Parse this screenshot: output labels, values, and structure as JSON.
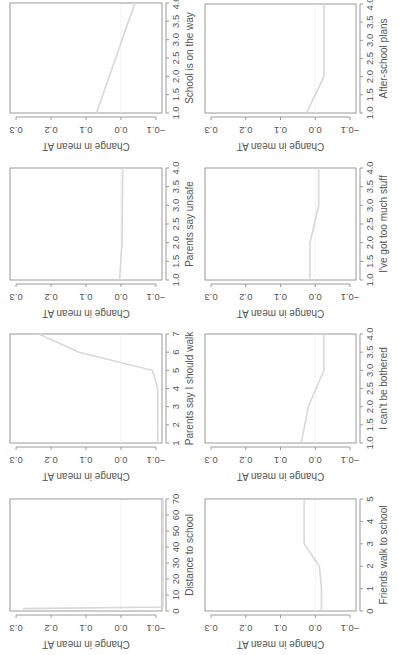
{
  "figure": {
    "line_color": "#d8d8d8",
    "zero_line_color": "#e6e6e6",
    "axis_color": "#9a9a9a",
    "text_color": "#555555",
    "ylabel": "Change in mean AT",
    "rotation": "-90deg"
  },
  "chart_data": [
    {
      "type": "line",
      "title": "",
      "xlabel": "School is on the way",
      "ylabel": "Change in mean AT",
      "xlim": [
        1.0,
        4.0
      ],
      "xticks": [
        "1.0",
        "1.5",
        "2.0",
        "2.5",
        "3.0",
        "3.5",
        "4.0"
      ],
      "xtick_values": [
        1.0,
        1.5,
        2.0,
        2.5,
        3.0,
        3.5,
        4.0
      ],
      "ylim": [
        -0.1,
        0.3
      ],
      "yticks": [
        "-0.1",
        "0.0",
        "0.1",
        "0.2",
        "0.3"
      ],
      "x": [
        1.0,
        4.0
      ],
      "values": [
        0.07,
        -0.04
      ],
      "zero_line": true,
      "screen_box": {
        "left": 10,
        "top": 3,
        "width": 152,
        "height": 110
      }
    },
    {
      "type": "line",
      "title": "",
      "xlabel": "Parents say unsafe",
      "ylabel": "Change in mean AT",
      "xlim": [
        1.0,
        4.0
      ],
      "xticks": [
        "1.0",
        "1.5",
        "2.0",
        "2.5",
        "3.0",
        "3.5",
        "4.0"
      ],
      "xtick_values": [
        1.0,
        1.5,
        2.0,
        2.5,
        3.0,
        3.5,
        4.0
      ],
      "ylim": [
        -0.1,
        0.3
      ],
      "yticks": [
        "-0.1",
        "0.0",
        "0.1",
        "0.2",
        "0.3"
      ],
      "x": [
        1.0,
        2.0,
        4.0
      ],
      "values": [
        0.004,
        -0.003,
        -0.005
      ],
      "zero_line": true,
      "screen_box": {
        "left": 10,
        "top": 168,
        "width": 152,
        "height": 112
      }
    },
    {
      "type": "line",
      "title": "",
      "xlabel": "Parents say I should walk",
      "ylabel": "Change in mean AT",
      "xlim": [
        1,
        7
      ],
      "xticks": [
        "1",
        "2",
        "3",
        "4",
        "5",
        "6",
        "7"
      ],
      "xtick_values": [
        1,
        2,
        3,
        4,
        5,
        6,
        7
      ],
      "ylim": [
        -0.1,
        0.3
      ],
      "yticks": [
        "-0.1",
        "0.0",
        "0.1",
        "0.2",
        "0.3"
      ],
      "x": [
        1,
        4,
        5,
        6,
        7
      ],
      "values": [
        -0.105,
        -0.105,
        -0.09,
        0.12,
        0.235
      ],
      "zero_line": true,
      "screen_box": {
        "left": 10,
        "top": 334,
        "width": 152,
        "height": 109
      }
    },
    {
      "type": "line",
      "title": "",
      "xlabel": "Distance to school",
      "ylabel": "Change in mean AT",
      "xlim": [
        0,
        70
      ],
      "xticks": [
        "0",
        "10",
        "20",
        "30",
        "40",
        "50",
        "60",
        "70"
      ],
      "xtick_values": [
        0,
        10,
        20,
        30,
        40,
        50,
        60,
        70
      ],
      "ylim": [
        -0.1,
        0.3
      ],
      "yticks": [
        "-0.1",
        "0.0",
        "0.1",
        "0.2",
        "0.3"
      ],
      "x": [
        1.5,
        2.5,
        3.5,
        71
      ],
      "values": [
        0.28,
        -0.12,
        -0.12,
        -0.12
      ],
      "zero_line": true,
      "screen_box": {
        "left": 10,
        "top": 499,
        "width": 152,
        "height": 112
      }
    },
    {
      "type": "line",
      "title": "",
      "xlabel": "After-school plans",
      "ylabel": "Change in mean AT",
      "xlim": [
        1.0,
        4.0
      ],
      "xticks": [
        "1.0",
        "1.5",
        "2.0",
        "2.5",
        "3.0",
        "3.5",
        "4.0"
      ],
      "xtick_values": [
        1.0,
        1.5,
        2.0,
        2.5,
        3.0,
        3.5,
        4.0
      ],
      "ylim": [
        -0.1,
        0.3
      ],
      "yticks": [
        "-0.1",
        "0.0",
        "0.1",
        "0.2",
        "0.3"
      ],
      "x": [
        1.0,
        2.0,
        4.0
      ],
      "values": [
        0.025,
        -0.025,
        -0.025
      ],
      "zero_line": true,
      "screen_box": {
        "left": 205,
        "top": 4,
        "width": 151,
        "height": 109
      }
    },
    {
      "type": "line",
      "title": "",
      "xlabel": "I've got too much stuff",
      "ylabel": "Change in mean AT",
      "xlim": [
        1.0,
        4.0
      ],
      "xticks": [
        "1.0",
        "1.5",
        "2.0",
        "2.5",
        "3.0",
        "3.5",
        "4.0"
      ],
      "xtick_values": [
        1.0,
        1.5,
        2.0,
        2.5,
        3.0,
        3.5,
        4.0
      ],
      "ylim": [
        -0.1,
        0.3
      ],
      "yticks": [
        "-0.1",
        "0.0",
        "0.1",
        "0.2",
        "0.3"
      ],
      "x": [
        1.0,
        2.0,
        3.0,
        4.0
      ],
      "values": [
        0.015,
        0.015,
        -0.01,
        -0.01
      ],
      "zero_line": true,
      "screen_box": {
        "left": 205,
        "top": 168,
        "width": 151,
        "height": 112
      }
    },
    {
      "type": "line",
      "title": "",
      "xlabel": "I can't be bothered",
      "ylabel": "Change in mean AT",
      "xlim": [
        1.0,
        4.0
      ],
      "xticks": [
        "1.0",
        "1.5",
        "2.0",
        "2.5",
        "3.0",
        "3.5",
        "4.0"
      ],
      "xtick_values": [
        1.0,
        1.5,
        2.0,
        2.5,
        3.0,
        3.5,
        4.0
      ],
      "ylim": [
        -0.1,
        0.3
      ],
      "yticks": [
        "-0.1",
        "0.0",
        "0.1",
        "0.2",
        "0.3"
      ],
      "x": [
        1.0,
        2.0,
        3.0,
        4.0
      ],
      "values": [
        0.04,
        0.02,
        -0.025,
        -0.025
      ],
      "zero_line": true,
      "screen_box": {
        "left": 205,
        "top": 334,
        "width": 151,
        "height": 109
      }
    },
    {
      "type": "line",
      "title": "",
      "xlabel": "Friends walk to school",
      "ylabel": "Change in mean AT",
      "xlim": [
        0,
        5
      ],
      "xticks": [
        "0",
        "1",
        "2",
        "3",
        "4",
        "5"
      ],
      "xtick_values": [
        0,
        1,
        2,
        3,
        4,
        5
      ],
      "ylim": [
        -0.1,
        0.3
      ],
      "yticks": [
        "-0.1",
        "0.0",
        "0.1",
        "0.2",
        "0.3"
      ],
      "x": [
        0,
        1,
        2,
        3,
        5
      ],
      "values": [
        -0.018,
        -0.018,
        -0.012,
        0.032,
        0.032
      ],
      "zero_line": true,
      "screen_box": {
        "left": 205,
        "top": 499,
        "width": 151,
        "height": 112
      }
    }
  ]
}
